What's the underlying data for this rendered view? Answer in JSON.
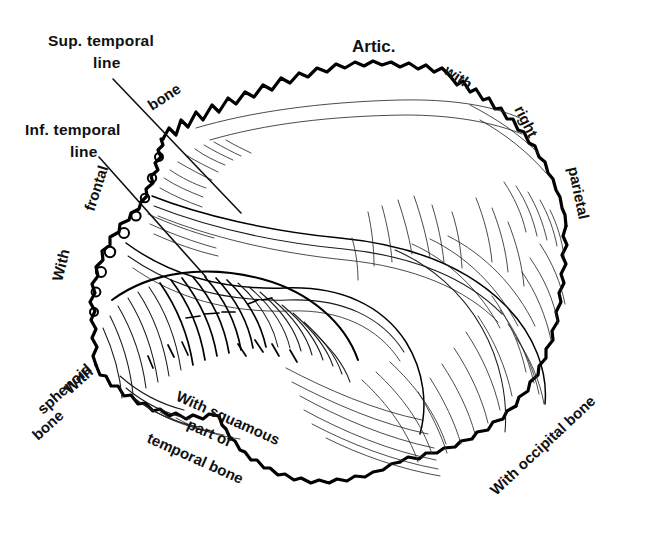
{
  "figure": {
    "background_color": "#ffffff",
    "ink_color": "#000000"
  },
  "labels": {
    "sup_temporal_line_1": "Sup. temporal",
    "sup_temporal_line_2": "line",
    "inf_temporal_line_1": "Inf. temporal",
    "inf_temporal_line_2": "line",
    "artic": "Artic.",
    "with_top": "with",
    "right": "right",
    "parietal": "parietal",
    "with_frontal_1": "With",
    "with_frontal_2": "frontal",
    "with_frontal_3": "bone",
    "with_sphenoid_1": "With",
    "with_sphenoid_2": "sphenoid",
    "with_sphenoid_3": "bone",
    "with_squamous_1": "With squamous",
    "with_squamous_2": "part of",
    "with_squamous_3": "temporal bone",
    "with_occipital": "With occipital bone"
  }
}
